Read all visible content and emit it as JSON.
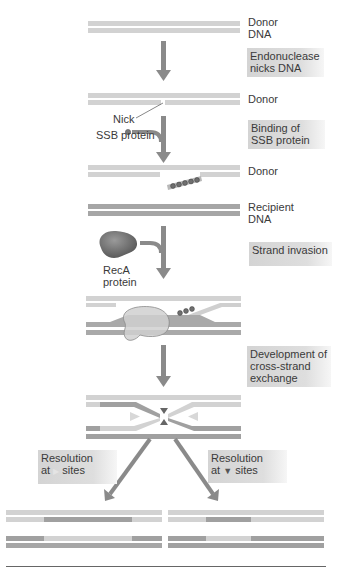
{
  "figure": {
    "type": "dna-recombination-diagram",
    "labels": {
      "donor_dna": [
        "Donor",
        "DNA"
      ],
      "donor_2": "Donor",
      "donor_3": "Donor",
      "recipient_dna": [
        "Recipient",
        "DNA"
      ],
      "nick": "Nick",
      "ssb_protein": "SSB protein",
      "reca_protein": [
        "RecA",
        "protein"
      ]
    },
    "steps": [
      {
        "id": "endonuclease",
        "lines": [
          "Endonuclease",
          "nicks DNA"
        ]
      },
      {
        "id": "ssb-binding",
        "lines": [
          "Binding of",
          "SSB protein"
        ]
      },
      {
        "id": "strand-invasion",
        "lines": [
          "Strand invasion"
        ]
      },
      {
        "id": "cross-strand",
        "lines": [
          "Development of",
          "cross-strand",
          "exchange"
        ]
      },
      {
        "id": "resolution-left",
        "lines": [
          "Resolution",
          "at",
          "sites"
        ],
        "site_symbol": "▶"
      },
      {
        "id": "resolution-right",
        "lines": [
          "Resolution",
          "at",
          "sites"
        ],
        "site_symbol": "▼"
      }
    ],
    "colors": {
      "light_strand": "#cfcfcf",
      "dark_strand": "#9a9a9a",
      "arrow": "#8a8a8a",
      "step_box": "#d6d6d6",
      "protein": "#7a7a7a",
      "reca_overlay": "#c8c8c8"
    }
  }
}
